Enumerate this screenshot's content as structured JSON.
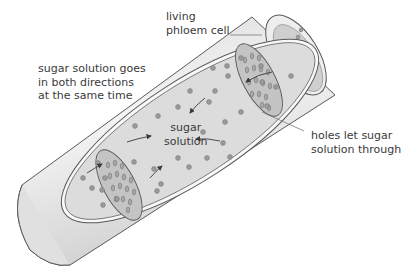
{
  "diagram": {
    "labels": {
      "cell": {
        "lines": [
          "living",
          "phloem cell"
        ]
      },
      "flow": {
        "lines": [
          "sugar solution goes",
          "in both directions",
          "at the same time"
        ]
      },
      "center": {
        "lines": [
          "sugar",
          "solution"
        ]
      },
      "holes": {
        "lines": [
          "holes let sugar",
          "solution through"
        ]
      }
    },
    "colors": {
      "tube_fill": "#e8e8e8",
      "tube_stroke": "#5a5a5a",
      "inner_fill": "#d9d9d9",
      "sieve_plate_fill": "#c4c4c4",
      "dot_fill": "#9a9a9a",
      "arrow": "#3a3a3a",
      "text": "#3a3a3a"
    }
  }
}
